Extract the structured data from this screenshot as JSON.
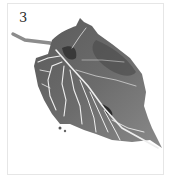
{
  "artwork": {
    "numeral": "3",
    "subject": "leaf-ink-wash-painting",
    "colors": {
      "background": "#ffffff",
      "border": "#e6e6e6",
      "leaf_dark": "#3c3c3c",
      "leaf_mid": "#6e6e6e",
      "leaf_light": "#9a9a9a",
      "veins": "#ececec",
      "numeral": "#2a2a2a"
    }
  }
}
